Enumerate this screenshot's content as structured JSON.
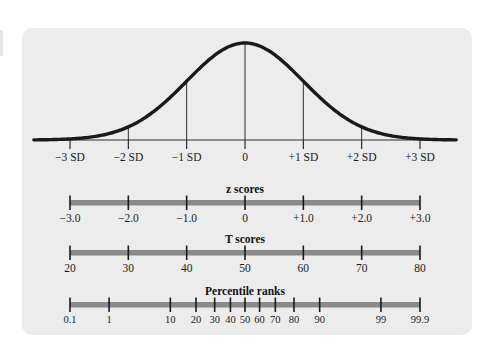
{
  "figure": {
    "background_color": "#ececec",
    "page_color": "#ffffff",
    "curve_color": "#1a1a1a",
    "bar_color": "#8a8a8a",
    "tick_color": "#1a1a1a"
  },
  "chart_data": {
    "type": "line",
    "title": "",
    "subtitle": "",
    "xlabel": "",
    "ylabel": "",
    "grid": false,
    "legend": "none",
    "distribution": {
      "name": "normal-curve",
      "mean": 0,
      "sd": 1,
      "xlim": [
        -3.6,
        3.6
      ],
      "ylim": [
        0,
        1
      ],
      "vertical_lines_at": [
        -2,
        -1,
        0,
        1,
        2
      ]
    },
    "scales": [
      {
        "id": "sd",
        "title": "",
        "kind": "baseline-axis",
        "z_positions": [
          -3,
          -2,
          -1,
          0,
          1,
          2,
          3
        ],
        "labels": [
          "−3 SD",
          "−2 SD",
          "−1 SD",
          "0",
          "+1 SD",
          "+2 SD",
          "+3 SD"
        ]
      },
      {
        "id": "z",
        "title": "z scores",
        "kind": "bar-scale",
        "z_positions": [
          -3,
          -2,
          -1,
          0,
          1,
          2,
          3
        ],
        "labels": [
          "−3.0",
          "−2.0",
          "−1.0",
          "0",
          "+1.0",
          "+2.0",
          "+3.0"
        ]
      },
      {
        "id": "t",
        "title": "T scores",
        "kind": "bar-scale",
        "z_positions": [
          -3,
          -2,
          -1,
          0,
          1,
          2,
          3
        ],
        "labels": [
          "20",
          "30",
          "40",
          "50",
          "60",
          "70",
          "80"
        ]
      },
      {
        "id": "percentile",
        "title": "Percentile ranks",
        "kind": "bar-scale",
        "z_positions": [
          -3.0,
          -2.33,
          -1.28,
          -0.84,
          -0.52,
          -0.25,
          0,
          0.25,
          0.52,
          0.84,
          1.28,
          2.33,
          3.0
        ],
        "labels": [
          "0.1",
          "1",
          "10",
          "20",
          "30",
          "40",
          "50",
          "60",
          "70",
          "80",
          "90",
          "99",
          "99.9"
        ]
      }
    ]
  }
}
